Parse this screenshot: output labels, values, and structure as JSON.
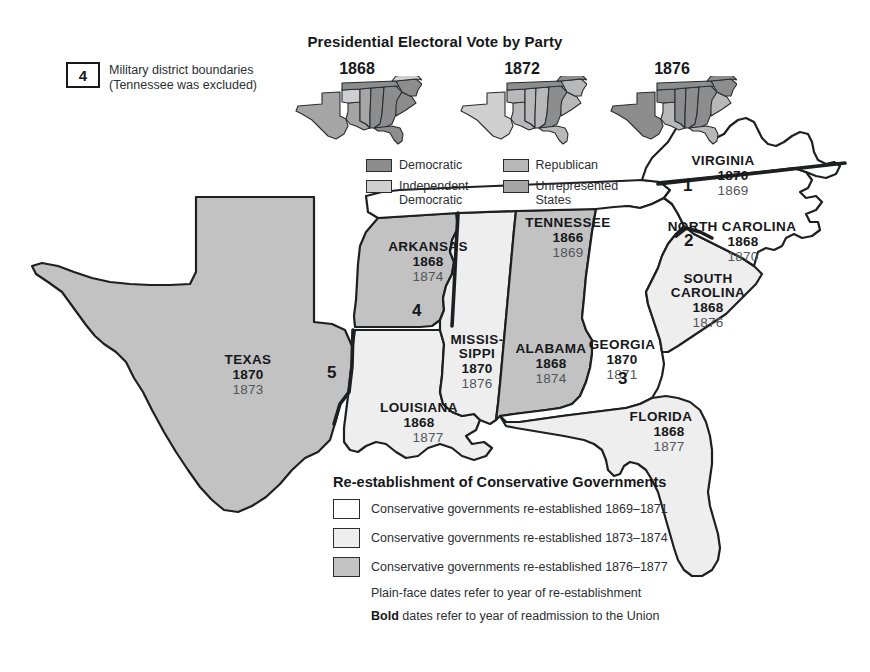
{
  "military_district_key": {
    "box_number": "4",
    "line1": "Military district boundaries",
    "line2": "(Tennessee was excluded)"
  },
  "electoral_panel": {
    "title": "Presidential Electoral Vote by Party",
    "maps": [
      {
        "year": "1868"
      },
      {
        "year": "1872"
      },
      {
        "year": "1876"
      }
    ],
    "legend": [
      {
        "label": "Democratic",
        "color": "#8d8d8d"
      },
      {
        "label": "Republican",
        "color": "#b8b8b8"
      },
      {
        "label": "Independent\nDemocratic",
        "label_line1": "Independent",
        "label_line2": "Democratic",
        "color": "#cfcfcf"
      },
      {
        "label": "Unrepresented\nStates",
        "label_line1": "Unrepresented",
        "label_line2": "States",
        "color": "#a5a5a5"
      }
    ]
  },
  "conservative_legend": {
    "title": "Re-establishment of Conservative Governments",
    "rows": [
      {
        "color": "#ffffff",
        "text": "Conservative governments re-established 1869–1871"
      },
      {
        "color": "#eeeeee",
        "text": "Conservative governments re-established 1873–1874"
      },
      {
        "color": "#c2c2c2",
        "text": "Conservative governments re-established 1876–1877"
      }
    ],
    "note_plain": "Plain-face dates refer to year of re-establishment",
    "note_bold_word": "Bold",
    "note_bold_rest": " dates refer to year of readmission to the Union"
  },
  "colors": {
    "fill_early": "#ffffff",
    "fill_mid": "#eeeeee",
    "fill_late": "#c2c2c2",
    "outline": "#1d1f21",
    "district_line": "#1d1f21"
  },
  "states": [
    {
      "id": "texas",
      "name": "TEXAS",
      "readmission": "1870",
      "reestablished": "1873",
      "fill": "#c2c2c2",
      "label_x": 248,
      "label_y": 352
    },
    {
      "id": "arkansas",
      "name": "ARKANSAS",
      "readmission": "1868",
      "reestablished": "1874",
      "fill": "#c2c2c2",
      "label_x": 428,
      "label_y": 239
    },
    {
      "id": "louisiana",
      "name": "LOUISIANA",
      "readmission": "1868",
      "reestablished": "1877",
      "fill": "#eeeeee",
      "label_x": 419,
      "label_y": 400
    },
    {
      "id": "mississippi",
      "name": "MISSIS-SIPPI",
      "name_line1": "MISSIS-",
      "name_line2": "SIPPI",
      "readmission": "1870",
      "reestablished": "1876",
      "fill": "#eeeeee",
      "label_x": 477,
      "label_y": 333
    },
    {
      "id": "alabama",
      "name": "ALABAMA",
      "readmission": "1868",
      "reestablished": "1874",
      "fill": "#c2c2c2",
      "label_x": 551,
      "label_y": 341
    },
    {
      "id": "tennessee",
      "name": "TENNESSEE",
      "readmission": "1866",
      "reestablished": "1869",
      "fill": "#ffffff",
      "label_x": 568,
      "label_y": 215
    },
    {
      "id": "georgia",
      "name": "GEORGIA",
      "readmission": "1870",
      "reestablished": "1871",
      "fill": "#ffffff",
      "label_x": 622,
      "label_y": 337
    },
    {
      "id": "florida",
      "name": "FLORIDA",
      "readmission": "1868",
      "reestablished": "1877",
      "fill": "#eeeeee",
      "label_x": 661,
      "label_y": 409
    },
    {
      "id": "south-carolina",
      "name": "SOUTH CAROLINA",
      "name_line1": "SOUTH",
      "name_line2": "CAROLINA",
      "readmission": "1868",
      "reestablished": "1876",
      "fill": "#eeeeee",
      "label_x": 708,
      "label_y": 272
    },
    {
      "id": "north-carolina",
      "name": "NORTH CAROLINA",
      "readmission": "1868",
      "reestablished": "1870",
      "fill": "#ffffff",
      "label_x": 732,
      "label_y": 219
    },
    {
      "id": "virginia",
      "name": "VIRGINIA",
      "readmission": "1870",
      "reestablished": "1869",
      "fill": "#ffffff",
      "label_x": 723,
      "label_y": 153
    }
  ],
  "district_numbers": [
    {
      "label": "1",
      "x": 687,
      "y": 176
    },
    {
      "label": "2",
      "x": 689,
      "y": 236
    },
    {
      "label": "3",
      "x": 623,
      "y": 378
    },
    {
      "label": "4",
      "x": 416,
      "y": 311
    },
    {
      "label": "5",
      "x": 331,
      "y": 372
    }
  ]
}
